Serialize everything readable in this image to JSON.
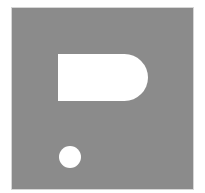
{
  "image": {
    "description": "Gray square icon with a white rounded-right bar and a white dot (stylized question-mark/placeholder glyph)",
    "colors": {
      "background": "#ffffff",
      "square": "#8b8b8b",
      "shapes": "#ffffff"
    },
    "icon_name": "question-mark-placeholder-icon"
  }
}
